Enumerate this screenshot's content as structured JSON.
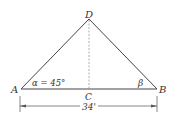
{
  "diagram": {
    "type": "triangle",
    "points": {
      "A": {
        "label": "A"
      },
      "B": {
        "label": "B"
      },
      "C": {
        "label": "C"
      },
      "D": {
        "label": "D"
      }
    },
    "angles": {
      "alpha": "α = 45°",
      "beta": "β"
    },
    "dimension": {
      "label": "34'"
    },
    "colors": {
      "line": "#444444",
      "text": "#333333",
      "dashed": "#888888"
    }
  }
}
